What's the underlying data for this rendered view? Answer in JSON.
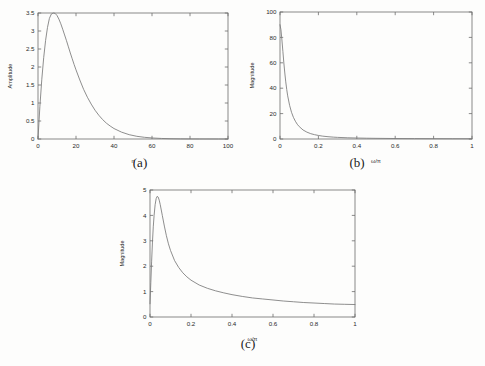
{
  "figure": {
    "background": "#fdfdfc",
    "axis_color": "#6d6d6d",
    "curve_color": "#7a7a7a",
    "text_color": "#2a2a2a"
  },
  "captions": {
    "a": "(a)",
    "b": "(b)",
    "c": "(c)"
  },
  "chart_data": [
    {
      "id": "panel-a",
      "type": "line",
      "title": "",
      "xlabel": "n",
      "ylabel": "Amplitude",
      "xlim": [
        0,
        100
      ],
      "ylim": [
        0,
        3.5
      ],
      "xticks": [
        0,
        20,
        40,
        60,
        80,
        100
      ],
      "xticklabels": [
        "0",
        "20",
        "40",
        "60",
        "80",
        "100"
      ],
      "yticks": [
        0,
        0.5,
        1,
        1.5,
        2,
        2.5,
        3,
        3.5
      ],
      "yticklabels": [
        "0",
        "0.5",
        "1",
        "1.5",
        "2",
        "2.5",
        "3",
        "3.5"
      ],
      "grid": false,
      "legend": null,
      "x": [
        0,
        1,
        2,
        3,
        4,
        5,
        6,
        7,
        8,
        9,
        10,
        11,
        12,
        13,
        14,
        15,
        16,
        17,
        18,
        19,
        20,
        22,
        24,
        26,
        28,
        30,
        32,
        34,
        36,
        38,
        40,
        44,
        48,
        52,
        56,
        60,
        65,
        70,
        75,
        80,
        85,
        90,
        95,
        100
      ],
      "y": [
        0,
        0.91,
        1.66,
        2.26,
        2.74,
        3.1,
        3.35,
        3.47,
        3.5,
        3.49,
        3.43,
        3.33,
        3.2,
        3.05,
        2.89,
        2.73,
        2.56,
        2.39,
        2.23,
        2.07,
        1.92,
        1.64,
        1.38,
        1.16,
        0.97,
        0.8,
        0.66,
        0.54,
        0.44,
        0.36,
        0.29,
        0.19,
        0.12,
        0.075,
        0.047,
        0.029,
        0.015,
        0.0077,
        0.0039,
        0.0019,
        0.001,
        0.0005,
        0.0002,
        0.0001
      ]
    },
    {
      "id": "panel-b",
      "type": "line",
      "title": "",
      "xlabel": "ω/π",
      "ylabel": "Magnitude",
      "xlim": [
        0,
        1
      ],
      "ylim": [
        0,
        100
      ],
      "xticks": [
        0,
        0.2,
        0.4,
        0.6,
        0.8,
        1
      ],
      "xticklabels": [
        "0",
        "0.2",
        "0.4",
        "0.6",
        "0.8",
        "1"
      ],
      "yticks": [
        0,
        20,
        40,
        60,
        80,
        100
      ],
      "yticklabels": [
        "0",
        "20",
        "40",
        "60",
        "80",
        "100"
      ],
      "grid": false,
      "legend": null,
      "x": [
        0,
        0.005,
        0.01,
        0.015,
        0.02,
        0.025,
        0.03,
        0.035,
        0.04,
        0.05,
        0.06,
        0.07,
        0.08,
        0.09,
        0.1,
        0.12,
        0.14,
        0.16,
        0.18,
        0.2,
        0.22,
        0.25,
        0.28,
        0.3,
        0.35,
        0.4,
        0.45,
        0.5,
        0.6,
        0.7,
        0.8,
        0.9,
        1.0
      ],
      "y": [
        90,
        86,
        78,
        69,
        60,
        52,
        45,
        39,
        34,
        26.5,
        21,
        17,
        14,
        11.6,
        9.8,
        7.1,
        5.4,
        4.2,
        3.4,
        2.8,
        2.3,
        1.8,
        1.45,
        1.28,
        0.96,
        0.76,
        0.62,
        0.52,
        0.38,
        0.3,
        0.25,
        0.22,
        0.2
      ]
    },
    {
      "id": "panel-c",
      "type": "line",
      "title": "",
      "xlabel": "ω/π",
      "ylabel": "Magnitude",
      "xlim": [
        0,
        1
      ],
      "ylim": [
        0,
        5
      ],
      "xticks": [
        0,
        0.2,
        0.4,
        0.6,
        0.8,
        1
      ],
      "xticklabels": [
        "0",
        "0.2",
        "0.4",
        "0.6",
        "0.8",
        "1"
      ],
      "yticks": [
        0,
        1,
        2,
        3,
        4,
        5
      ],
      "yticklabels": [
        "0",
        "1",
        "2",
        "3",
        "4",
        "5"
      ],
      "grid": false,
      "legend": null,
      "x": [
        0,
        0.004,
        0.008,
        0.012,
        0.016,
        0.02,
        0.025,
        0.03,
        0.035,
        0.04,
        0.045,
        0.05,
        0.06,
        0.07,
        0.08,
        0.09,
        0.1,
        0.12,
        0.14,
        0.16,
        0.18,
        0.2,
        0.24,
        0.28,
        0.32,
        0.36,
        0.4,
        0.45,
        0.5,
        0.55,
        0.6,
        0.65,
        0.7,
        0.75,
        0.8,
        0.85,
        0.9,
        0.95,
        1.0
      ],
      "y": [
        0.52,
        1.35,
        2.2,
        2.95,
        3.55,
        4.0,
        4.42,
        4.66,
        4.75,
        4.72,
        4.6,
        4.42,
        4.0,
        3.58,
        3.2,
        2.88,
        2.62,
        2.22,
        1.95,
        1.74,
        1.58,
        1.45,
        1.26,
        1.13,
        1.03,
        0.95,
        0.88,
        0.81,
        0.75,
        0.71,
        0.67,
        0.63,
        0.6,
        0.57,
        0.55,
        0.53,
        0.51,
        0.5,
        0.49
      ]
    }
  ]
}
